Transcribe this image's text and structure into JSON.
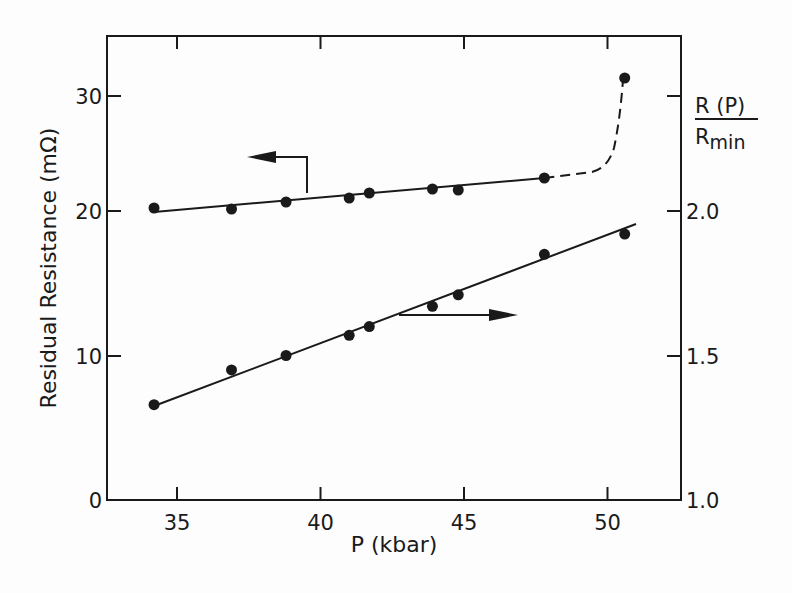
{
  "chart_data": {
    "type": "scatter",
    "title": "",
    "xlabel": "P (kbar)",
    "ylabel": "Residual Resistance (mΩ)",
    "ylabel_right": "R(P)/R_min",
    "ylabel_right_num": "R (P)",
    "ylabel_right_den": "R",
    "ylabel_right_den_sub": "min",
    "xlim": [
      32.5,
      51.5
    ],
    "ylim": [
      0,
      33
    ],
    "ylim_right": [
      1.0,
      2.15
    ],
    "x_ticks": [
      35,
      40,
      45,
      50
    ],
    "x_tick_labels": [
      "35",
      "40",
      "45",
      "50"
    ],
    "y_ticks": [
      0,
      10,
      20,
      30
    ],
    "y_tick_labels": [
      "0",
      "10",
      "20",
      "30"
    ],
    "y_right_ticks": [
      1.0,
      1.5,
      2.0
    ],
    "y_right_tick_labels": [
      "1.0",
      "1.5",
      "2.0"
    ],
    "grid": false,
    "series": [
      {
        "name": "Residual Resistance",
        "axis": "left",
        "x": [
          34.2,
          36.9,
          38.8,
          41.0,
          41.7,
          43.9,
          44.8,
          47.8,
          50.6
        ],
        "y": [
          20.2,
          20.1,
          20.6,
          20.9,
          21.2,
          21.5,
          21.5,
          22.3,
          31.0
        ],
        "fit": "linear up to ~48 kbar, dashed curve rising steeply to last point",
        "indicator": "arrow pointing left"
      },
      {
        "name": "R(P)/Rmin",
        "axis": "right",
        "x": [
          34.2,
          36.9,
          38.8,
          41.0,
          41.7,
          43.9,
          44.8,
          47.8,
          50.6
        ],
        "y": [
          1.33,
          1.45,
          1.5,
          1.57,
          1.6,
          1.67,
          1.71,
          1.85,
          1.92
        ],
        "fit": "linear",
        "indicator": "arrow pointing right"
      }
    ]
  }
}
